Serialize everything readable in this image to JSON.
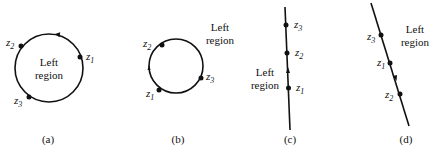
{
  "figures": [
    {
      "id": "a",
      "caption": "(a)",
      "region_label_line1": "Left",
      "region_label_line2": "region",
      "points": [
        {
          "name": "z",
          "sub": "1"
        },
        {
          "name": "z",
          "sub": "2"
        },
        {
          "name": "z",
          "sub": "3"
        }
      ],
      "shape": "circle",
      "direction": "counterclockwise"
    },
    {
      "id": "b",
      "caption": "(b)",
      "region_label_line1": "Left",
      "region_label_line2": "region",
      "points": [
        {
          "name": "z",
          "sub": "2"
        },
        {
          "name": "z",
          "sub": "3"
        },
        {
          "name": "z",
          "sub": "1"
        }
      ],
      "shape": "circle",
      "direction": "clockwise"
    },
    {
      "id": "c",
      "caption": "(c)",
      "region_label_line1": "Left",
      "region_label_line2": "region",
      "points": [
        {
          "name": "z",
          "sub": "3"
        },
        {
          "name": "z",
          "sub": "2"
        },
        {
          "name": "z",
          "sub": "1"
        }
      ],
      "shape": "line",
      "direction": "upward"
    },
    {
      "id": "d",
      "caption": "(d)",
      "region_label_line1": "Left",
      "region_label_line2": "region",
      "points": [
        {
          "name": "z",
          "sub": "3"
        },
        {
          "name": "z",
          "sub": "1"
        },
        {
          "name": "z",
          "sub": "2"
        }
      ],
      "shape": "line",
      "direction": "downward"
    }
  ]
}
